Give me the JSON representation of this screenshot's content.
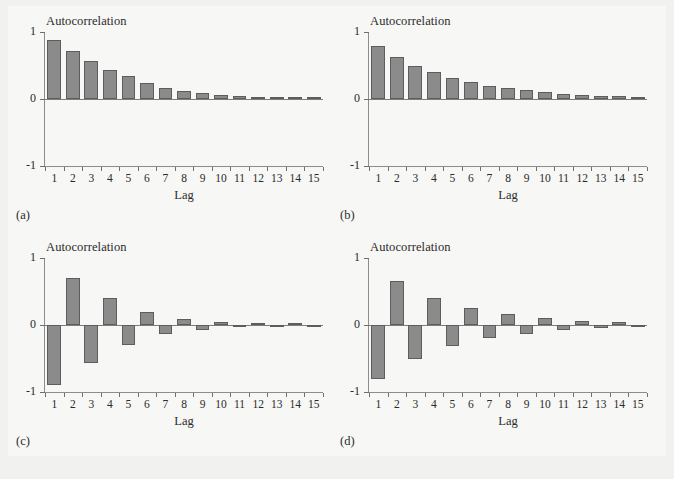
{
  "figure": {
    "background_color": "#f1f1ef",
    "plate_color": "#f7f7f5",
    "bar_fill": "#8b8b8b",
    "bar_edge": "#5d5d5d",
    "axis_color": "#8d8d8d",
    "text_color": "#2a2a2a"
  },
  "panels": [
    {
      "key": "a",
      "label": "(a)"
    },
    {
      "key": "b",
      "label": "(b)"
    },
    {
      "key": "c",
      "label": "(c)"
    },
    {
      "key": "d",
      "label": "(d)"
    }
  ],
  "axis": {
    "ylabel": "Autocorrelation",
    "xlabel": "Lag",
    "yticks": [
      "1",
      "0",
      "-1"
    ],
    "ytick_values": [
      1,
      0,
      -1
    ],
    "ylim": [
      -1,
      1
    ],
    "xticks": [
      "1",
      "2",
      "3",
      "4",
      "5",
      "6",
      "7",
      "8",
      "9",
      "10",
      "11",
      "12",
      "13",
      "14",
      "15"
    ]
  },
  "chart_data": [
    {
      "type": "bar",
      "panel": "(a)",
      "title": "Autocorrelation",
      "xlabel": "Lag",
      "ylabel": "Autocorrelation",
      "ylim": [
        -1,
        1
      ],
      "grid": false,
      "legend": "none",
      "categories": [
        1,
        2,
        3,
        4,
        5,
        6,
        7,
        8,
        9,
        10,
        11,
        12,
        13,
        14,
        15
      ],
      "values": [
        0.88,
        0.71,
        0.56,
        0.44,
        0.34,
        0.24,
        0.17,
        0.12,
        0.09,
        0.06,
        0.05,
        0.03,
        0.02,
        0.02,
        0.01
      ]
    },
    {
      "type": "bar",
      "panel": "(b)",
      "title": "Autocorrelation",
      "xlabel": "Lag",
      "ylabel": "Autocorrelation",
      "ylim": [
        -1,
        1
      ],
      "grid": false,
      "legend": "none",
      "categories": [
        1,
        2,
        3,
        4,
        5,
        6,
        7,
        8,
        9,
        10,
        11,
        12,
        13,
        14,
        15
      ],
      "values": [
        0.79,
        0.62,
        0.5,
        0.4,
        0.32,
        0.25,
        0.2,
        0.16,
        0.13,
        0.1,
        0.08,
        0.06,
        0.05,
        0.04,
        0.03
      ]
    },
    {
      "type": "bar",
      "panel": "(c)",
      "title": "Autocorrelation",
      "xlabel": "Lag",
      "ylabel": "Autocorrelation",
      "ylim": [
        -1,
        1
      ],
      "grid": false,
      "legend": "none",
      "categories": [
        1,
        2,
        3,
        4,
        5,
        6,
        7,
        8,
        9,
        10,
        11,
        12,
        13,
        14,
        15
      ],
      "values": [
        -0.9,
        0.7,
        -0.56,
        0.41,
        -0.3,
        0.2,
        -0.14,
        0.09,
        -0.07,
        0.04,
        -0.03,
        0.02,
        -0.01,
        0.01,
        -0.01
      ]
    },
    {
      "type": "bar",
      "panel": "(d)",
      "title": "Autocorrelation",
      "xlabel": "Lag",
      "ylabel": "Autocorrelation",
      "ylim": [
        -1,
        1
      ],
      "grid": false,
      "legend": "none",
      "categories": [
        1,
        2,
        3,
        4,
        5,
        6,
        7,
        8,
        9,
        10,
        11,
        12,
        13,
        14,
        15
      ],
      "values": [
        -0.8,
        0.65,
        -0.5,
        0.4,
        -0.31,
        0.25,
        -0.2,
        0.16,
        -0.13,
        0.1,
        -0.08,
        0.06,
        -0.05,
        0.04,
        -0.03
      ]
    }
  ]
}
